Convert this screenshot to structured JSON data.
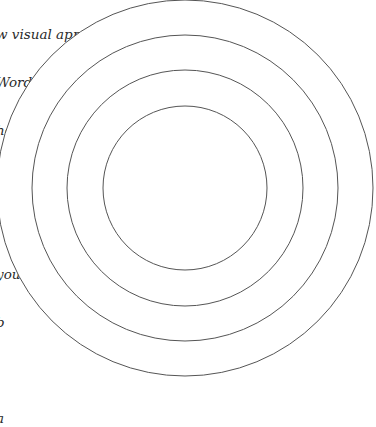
{
  "document": {
    "text_lines": [
      "w visual appeals to",
      "Word in your",
      "he center of",
      "ion and",
      "",
      "you",
      "b",
      "",
      "a"
    ]
  },
  "figure": {
    "type": "concentric-circles",
    "center": [
      185,
      188
    ],
    "radii": [
      82,
      118,
      153,
      188
    ],
    "stroke_color": "#555555",
    "stroke_width": 1
  }
}
